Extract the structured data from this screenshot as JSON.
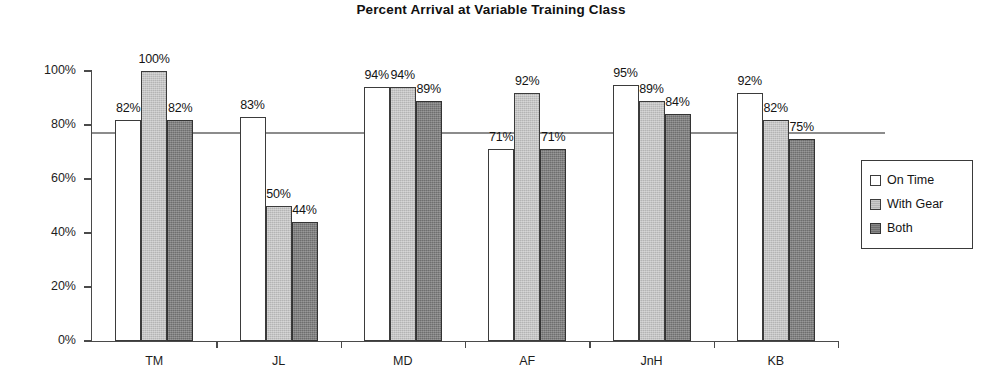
{
  "chart_data": {
    "type": "bar",
    "title": "Percent Arrival at Variable Training Class",
    "xlabel": "",
    "ylabel": "% Arrived",
    "categories": [
      "TM",
      "JL",
      "MD",
      "AF",
      "JnH",
      "KB"
    ],
    "series": [
      {
        "name": "On Time",
        "values": [
          82,
          83,
          94,
          71,
          95,
          92
        ],
        "color": "#ffffff"
      },
      {
        "name": "With Gear",
        "values": [
          100,
          50,
          94,
          92,
          89,
          82
        ],
        "color": "#b4b4b4"
      },
      {
        "name": "Both",
        "values": [
          82,
          44,
          89,
          71,
          84,
          75
        ],
        "color": "#6e6e6e"
      }
    ],
    "value_labels": [
      [
        "82%",
        "83%",
        "94%",
        "71%",
        "95%",
        "92%"
      ],
      [
        "100%",
        "50%",
        "94%",
        "92%",
        "89%",
        "82%"
      ],
      [
        "82%",
        "44%",
        "89%",
        "71%",
        "84%",
        "75%"
      ]
    ],
    "ylim": [
      0,
      100
    ],
    "yticks": [
      0,
      20,
      40,
      60,
      80,
      100
    ],
    "ytick_labels": [
      "0%",
      "20%",
      "40%",
      "60%",
      "80%",
      "100%"
    ],
    "grid": false,
    "legend_position": "right",
    "reference_line": {
      "value": 77,
      "color": "#8c8c8c"
    }
  },
  "legend": {
    "entries": [
      "On Time",
      "With Gear",
      "Both"
    ]
  }
}
